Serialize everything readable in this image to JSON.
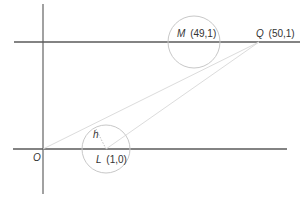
{
  "diagram": {
    "points": {
      "O": {
        "name": "O",
        "label": "O"
      },
      "L": {
        "name": "L",
        "coords": "(1,0)"
      },
      "M": {
        "name": "M",
        "coords": "(49,1)"
      },
      "Q": {
        "name": "Q",
        "coords": "(50,1)"
      }
    },
    "h_label": "h",
    "colors": {
      "axis": "#8a8a8a",
      "horizontal_line": "#5a5a5a",
      "circle": "#c8c8c8",
      "ray": "#dcdcdc",
      "text": "#333333"
    }
  }
}
